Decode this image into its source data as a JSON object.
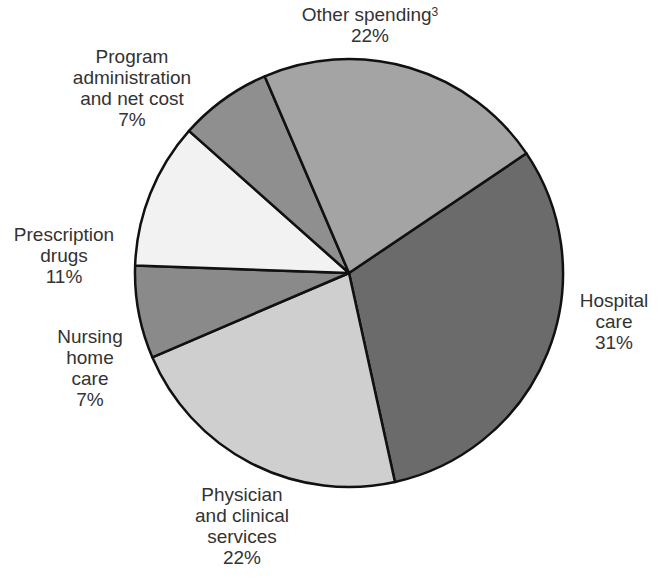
{
  "chart_data": {
    "type": "pie",
    "title": "",
    "start_angle_deg": -34,
    "direction": "clockwise",
    "slices": [
      {
        "label": "Hospital care",
        "value": 31,
        "display": "31%",
        "color": "#6b6b6b"
      },
      {
        "label": "Physician and clinical services",
        "value": 22,
        "display": "22%",
        "color": "#cfcfcf"
      },
      {
        "label": "Nursing home care",
        "value": 7,
        "display": "7%",
        "color": "#8a8a8a"
      },
      {
        "label": "Prescription drugs",
        "value": 11,
        "display": "11%",
        "color": "#f2f2f2"
      },
      {
        "label": "Program administration and net cost",
        "value": 7,
        "display": "7%",
        "color": "#8f8f8f"
      },
      {
        "label": "Other spending",
        "footnote": "3",
        "value": 22,
        "display": "22%",
        "color": "#a4a4a4"
      }
    ]
  },
  "labels": {
    "other": {
      "l1": "Other spending",
      "sup": "3",
      "pct": "22%"
    },
    "program": {
      "l1": "Program",
      "l2": "administration",
      "l3": "and net cost",
      "pct": "7%"
    },
    "prescription": {
      "l1": "Prescription",
      "l2": "drugs",
      "pct": "11%"
    },
    "nursing": {
      "l1": "Nursing",
      "l2": "home",
      "l3": "care",
      "pct": "7%"
    },
    "physician": {
      "l1": "Physician",
      "l2": "and clinical",
      "l3": "services",
      "pct": "22%"
    },
    "hospital": {
      "l1": "Hospital",
      "l2": "care",
      "pct": "31%"
    }
  }
}
